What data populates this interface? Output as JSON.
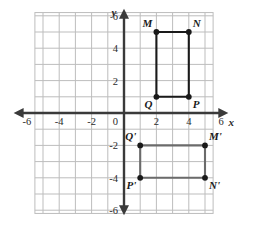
{
  "figure": {
    "background_color": "#ffffff",
    "grid_color": "#bdbdbd",
    "axis_color": "#3a3a3a",
    "shape1_color": "#1a1a1a",
    "shape2_color": "#6b6b6b",
    "point_color": "#1a1a1a"
  },
  "axes": {
    "x_label": "x",
    "y_label": "y",
    "x_min": -7,
    "x_max": 6.5,
    "y_min": -6.5,
    "y_max": 6.5,
    "x_ticks": [
      {
        "value": -6,
        "label": "-6"
      },
      {
        "value": -4,
        "label": "-4"
      },
      {
        "value": -2,
        "label": "-2"
      },
      {
        "value": 2,
        "label": "2"
      },
      {
        "value": 4,
        "label": "4"
      },
      {
        "value": 6,
        "label": "6"
      }
    ],
    "y_ticks": [
      {
        "value": 6,
        "label": "6"
      },
      {
        "value": 4,
        "label": "4"
      },
      {
        "value": 2,
        "label": "2"
      },
      {
        "value": -2,
        "label": "-2"
      },
      {
        "value": -4,
        "label": "-4"
      },
      {
        "value": -6,
        "label": "-6"
      }
    ],
    "origin_label": "0",
    "grid_step": 1,
    "arrows": [
      "left",
      "right",
      "up",
      "down"
    ]
  },
  "chart_data": {
    "type": "scatter",
    "xlabel": "x",
    "ylabel": "y",
    "xlim": [
      -7,
      6.5
    ],
    "ylim": [
      -6.5,
      6.5
    ],
    "grid": true,
    "legend": "none",
    "series": [
      {
        "name": "MNPQ",
        "color": "#1a1a1a",
        "closed": true,
        "points": [
          {
            "label": "M",
            "x": 2,
            "y": 5,
            "label_pos": "above-left"
          },
          {
            "label": "N",
            "x": 4,
            "y": 5,
            "label_pos": "above-right"
          },
          {
            "label": "P",
            "x": 4,
            "y": 1,
            "label_pos": "below-right"
          },
          {
            "label": "Q",
            "x": 2,
            "y": 1,
            "label_pos": "below-left"
          }
        ]
      },
      {
        "name": "M'N'P'Q'",
        "color": "#6b6b6b",
        "closed": true,
        "points": [
          {
            "label": "Q'",
            "x": 1,
            "y": -2,
            "label_pos": "above-left"
          },
          {
            "label": "M'",
            "x": 5,
            "y": -2,
            "label_pos": "above-right"
          },
          {
            "label": "N'",
            "x": 5,
            "y": -4,
            "label_pos": "below-right"
          },
          {
            "label": "P'",
            "x": 1,
            "y": -4,
            "label_pos": "below-left"
          }
        ]
      }
    ]
  }
}
